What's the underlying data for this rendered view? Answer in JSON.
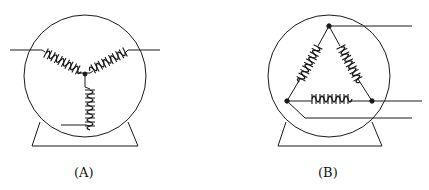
{
  "figure": {
    "panels": [
      {
        "id": "A",
        "label": "(A)",
        "connection": "wye (star)",
        "coils": 3
      },
      {
        "id": "B",
        "label": "(B)",
        "connection": "delta",
        "coils": 3
      }
    ],
    "colors": {
      "line": "#1a1a1a",
      "background": "#ffffff"
    }
  }
}
